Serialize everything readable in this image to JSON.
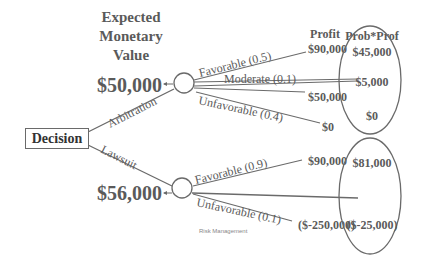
{
  "header": {
    "ev_title_line1": "Expected",
    "ev_title_line2": "Monetary",
    "ev_title_line3": "Value",
    "profit_header": "Profit",
    "prob_prof_header": "Prob*Prof"
  },
  "decision_node": {
    "label": "Decision"
  },
  "branches": [
    {
      "label": "Arbitration",
      "expected_value": "$50,000",
      "outcomes": [
        {
          "label": "Favorable (0.5)",
          "profit": "$90,000",
          "prob_prof": "$45,000"
        },
        {
          "label": "Moderate (0.1)",
          "profit": "$50,000",
          "prob_prof": "$5,000"
        },
        {
          "label": "Unfavorable (0.4)",
          "profit": "$0",
          "prob_prof": "$0"
        }
      ]
    },
    {
      "label": "Lawsuit",
      "expected_value": "$56,000",
      "outcomes": [
        {
          "label": "Favorable (0.9)",
          "profit": "$90,000",
          "prob_prof": "$81,000"
        },
        {
          "label": "Unfavorable (0.1)",
          "profit": "($-250,000)",
          "prob_prof": "($-25,000)"
        }
      ]
    }
  ],
  "footer": {
    "text": "Risk Management"
  },
  "colors": {
    "line": "#6a6a6a",
    "text": "#5a5a5a",
    "dark_text": "#333333"
  }
}
